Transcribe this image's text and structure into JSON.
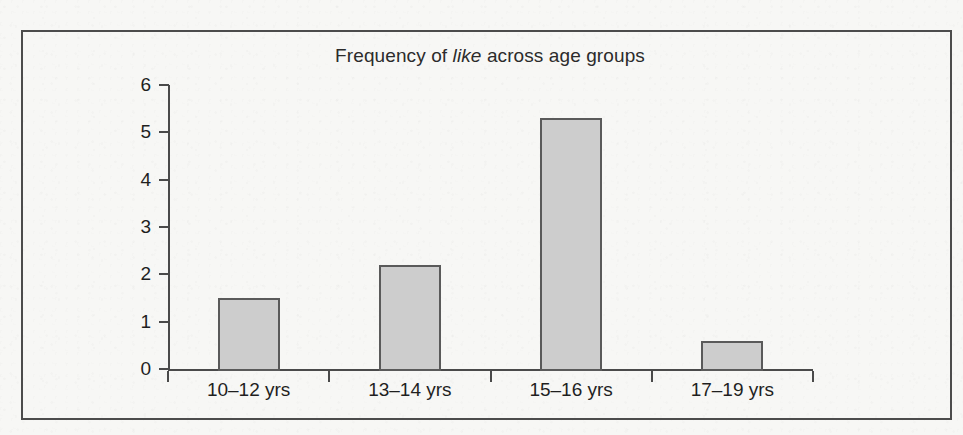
{
  "figure": {
    "background_color": "#f7f7f5",
    "border_color": "#4c4c4c"
  },
  "chart_data": {
    "type": "bar",
    "title": "Frequency of like across age groups",
    "title_parts": {
      "before": "Frequency of ",
      "italic": "like",
      "after": " across age groups"
    },
    "categories": [
      "10–12 yrs",
      "13–14 yrs",
      "15–16 yrs",
      "17–19 yrs"
    ],
    "values": [
      1.5,
      2.2,
      5.3,
      0.6
    ],
    "xlabel": "",
    "ylabel": "",
    "ylim": [
      0,
      6
    ],
    "yticks": [
      "0",
      "1",
      "2",
      "3",
      "4",
      "5",
      "6"
    ],
    "grid": false,
    "legend": false,
    "bar_fill_color": "#cdcdcd",
    "bar_edge_color": "#5a5a5a",
    "axis_color": "#4a4a4a"
  }
}
